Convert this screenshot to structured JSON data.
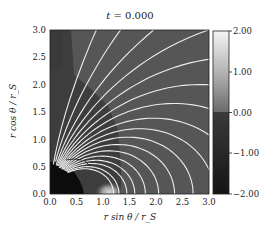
{
  "chart_data": {
    "type": "heatmap",
    "title": "t = 0.000",
    "title_var": "t",
    "title_value": "0.000",
    "xlabel": "r sin θ / r_S",
    "ylabel": "r cos θ / r_S",
    "xlim": [
      0.0,
      3.0
    ],
    "ylim": [
      0.0,
      3.0
    ],
    "xticks": [
      "0.0",
      "0.5",
      "1.0",
      "1.5",
      "2.0",
      "2.5",
      "3.0"
    ],
    "yticks": [
      "0.0",
      "0.5",
      "1.0",
      "1.5",
      "2.0",
      "2.5",
      "3.0"
    ],
    "colorbar": {
      "range": [
        -2.0,
        2.0
      ],
      "ticks": [
        "2.00",
        "1.00",
        "0.00",
        "−1.00",
        "−2.00"
      ],
      "colormap": "grayscale (dark = negative, light = positive)"
    },
    "regions": [
      {
        "name": "background",
        "value": -0.2,
        "color": "#555555"
      },
      {
        "name": "inner-shell (r < ~2.3, θ small)",
        "value": -0.7,
        "color": "#3e3e3e"
      },
      {
        "name": "horizon region (r < ~0.5)",
        "value": -2.0,
        "color": "#0e0e0e"
      },
      {
        "name": "dipole-core bright spot near (1.1, 0)",
        "value": 1.5,
        "color": "#cfcfcf"
      }
    ],
    "field_lines": {
      "color": "#e8e8e8",
      "description": "Dipole-like magnetic field lines closing onto the equatorial plane, centred near x ≈ 1.1",
      "count_open": 8,
      "count_closed": 12
    },
    "annotation": "small black contour near (0.4–0.7, 0.6)"
  }
}
